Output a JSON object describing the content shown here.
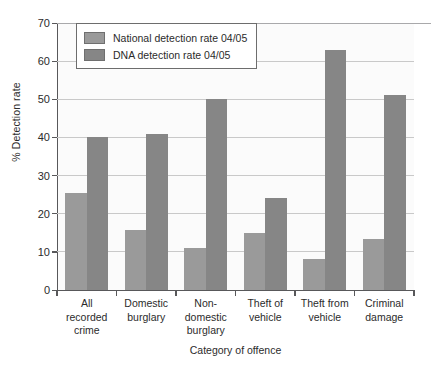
{
  "chart_data": {
    "type": "bar",
    "title": "",
    "xlabel": "Category of offence",
    "ylabel": "% Detection rate",
    "ylim": [
      0,
      70
    ],
    "ytick_step": 10,
    "yticks": [
      "70",
      "60",
      "50",
      "40",
      "30",
      "20",
      "10",
      "0"
    ],
    "grid": "horizontal",
    "legend_position": "top-left-inside",
    "categories": [
      "All recorded crime",
      "Domestic burglary",
      "Non-domestic burglary",
      "Theft of vehicle",
      "Theft from vehicle",
      "Criminal damage"
    ],
    "category_lines": [
      [
        "All",
        "recorded",
        "crime"
      ],
      [
        "Domestic",
        "burglary"
      ],
      [
        "Non-",
        "domestic",
        "burglary"
      ],
      [
        "Theft of",
        "vehicle"
      ],
      [
        "Theft from",
        "vehicle"
      ],
      [
        "Criminal",
        "damage"
      ]
    ],
    "series": [
      {
        "name": "National detection rate 04/05",
        "color": "#9a9a9a",
        "values": [
          25.5,
          15.7,
          11,
          15,
          8.2,
          13.5
        ]
      },
      {
        "name": "DNA detection rate 04/05",
        "color": "#868686",
        "values": [
          40,
          41,
          50,
          24,
          63,
          51
        ]
      }
    ]
  },
  "legend": {
    "items": [
      {
        "label": "National detection rate 04/05"
      },
      {
        "label": "DNA detection rate 04/05"
      }
    ]
  }
}
